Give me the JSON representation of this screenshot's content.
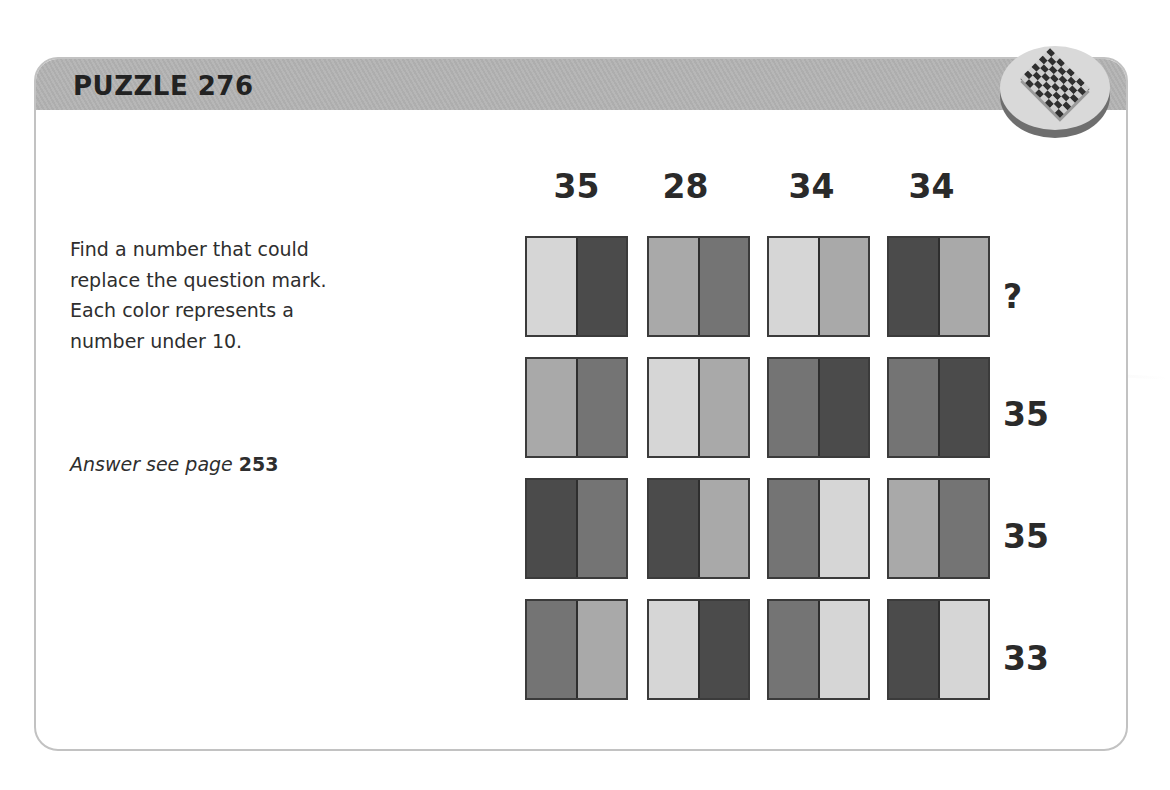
{
  "header": {
    "title": "PUZZLE 276",
    "badge_icon": "checkerboard-icon"
  },
  "instructions": {
    "text_lines": [
      "Find a number that could",
      "replace the question mark.",
      "Each color represents a",
      "number under 10."
    ],
    "answer_prefix": "Answer see page",
    "answer_page": "253"
  },
  "colors": {
    "light": "#d6d6d6",
    "mid": "#a9a9a9",
    "darkmid": "#747474",
    "dark": "#4b4b4b"
  },
  "grid": {
    "column_sums": [
      "35",
      "28",
      "34",
      "34"
    ],
    "row_sums": [
      "?",
      "35",
      "35",
      "33"
    ],
    "rows": [
      [
        [
          "light",
          "dark"
        ],
        [
          "mid",
          "darkmid"
        ],
        [
          "light",
          "mid"
        ],
        [
          "dark",
          "mid"
        ]
      ],
      [
        [
          "mid",
          "darkmid"
        ],
        [
          "light",
          "mid"
        ],
        [
          "darkmid",
          "dark"
        ],
        [
          "darkmid",
          "dark"
        ]
      ],
      [
        [
          "dark",
          "darkmid"
        ],
        [
          "dark",
          "mid"
        ],
        [
          "darkmid",
          "light"
        ],
        [
          "mid",
          "darkmid"
        ]
      ],
      [
        [
          "darkmid",
          "mid"
        ],
        [
          "light",
          "dark"
        ],
        [
          "darkmid",
          "light"
        ],
        [
          "dark",
          "light"
        ]
      ]
    ]
  }
}
